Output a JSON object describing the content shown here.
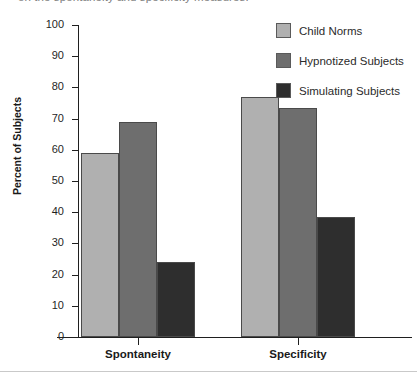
{
  "caption": {
    "text": "on the spontaneity and specificity measures."
  },
  "legend": {
    "position": "top-right",
    "items": [
      {
        "label": "Child Norms",
        "color": "#b0b0b0"
      },
      {
        "label": "Hypnotized Subjects",
        "color": "#6e6e6e"
      },
      {
        "label": "Simulating Subjects",
        "color": "#2e2e2e"
      }
    ]
  },
  "axes": {
    "y_title": "Percent of Subjects",
    "y_ticks": [
      "100",
      "90",
      "80",
      "70",
      "60",
      "50",
      "40",
      "30",
      "20",
      "10",
      "0"
    ],
    "x_labels": [
      "Spontaneity",
      "Specificity"
    ]
  },
  "chart_data": {
    "type": "bar",
    "title": "",
    "xlabel": "",
    "ylabel": "Percent of Subjects",
    "ylim": [
      0,
      100
    ],
    "ytick_step": 10,
    "grid": false,
    "legend_position": "top-right",
    "categories": [
      "Spontaneity",
      "Specificity"
    ],
    "series": [
      {
        "name": "Child Norms",
        "color": "#b0b0b0",
        "values": [
          59,
          77
        ]
      },
      {
        "name": "Hypnotized Subjects",
        "color": "#6e6e6e",
        "values": [
          69,
          73.5
        ]
      },
      {
        "name": "Simulating Subjects",
        "color": "#2e2e2e",
        "values": [
          24,
          38.5
        ]
      }
    ]
  }
}
